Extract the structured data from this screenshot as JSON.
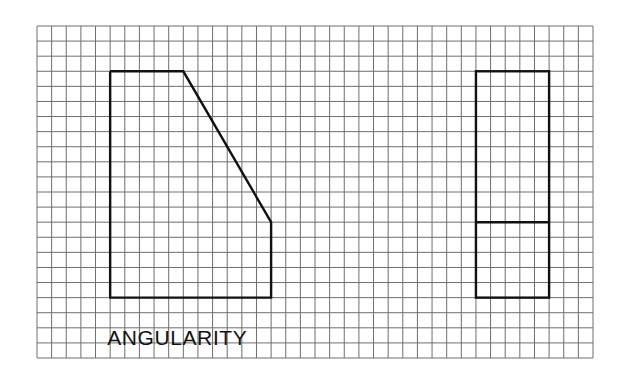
{
  "diagram": {
    "caption": "ANGULARITY",
    "grid": {
      "left": 37,
      "top": 26,
      "right": 593,
      "bottom": 358,
      "cols": 38,
      "rows": 22,
      "line_color": "#6e6e6e",
      "line_width": 1
    },
    "shape_color": "#111111",
    "shape_width": 2.4,
    "shapes": [
      {
        "name": "front-view",
        "points_grid": [
          [
            5,
            3
          ],
          [
            10,
            3
          ],
          [
            16,
            13
          ],
          [
            16,
            18
          ],
          [
            5,
            18
          ]
        ]
      },
      {
        "name": "side-view",
        "rect_grid": [
          30,
          3,
          35,
          18
        ],
        "divider_row": 13
      }
    ]
  }
}
